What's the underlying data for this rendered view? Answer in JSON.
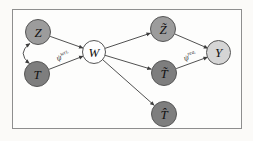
{
  "figure": {
    "type": "causal-graph",
    "nodes": [
      {
        "id": "Z",
        "label": "Z",
        "fill": "#9c9c9c"
      },
      {
        "id": "T",
        "label": "T",
        "fill": "#7e7e7e"
      },
      {
        "id": "W",
        "label": "W",
        "fill": "#fefefe"
      },
      {
        "id": "Z_tilde",
        "label": "Z̃",
        "fill": "#9c9c9c"
      },
      {
        "id": "T_tilde",
        "label": "T̃",
        "fill": "#7e7e7e"
      },
      {
        "id": "T_hat",
        "label": "T̂",
        "fill": "#7e7e7e"
      },
      {
        "id": "Y",
        "label": "Y",
        "fill": "#d5d5d5"
      }
    ],
    "edges": [
      {
        "from": "Z",
        "to": "W",
        "style": "arrow"
      },
      {
        "from": "T",
        "to": "W",
        "style": "arrow",
        "label_ref": "psi_wri"
      },
      {
        "from": "Z",
        "to": "T",
        "style": "curved-bidirectional"
      },
      {
        "from": "W",
        "to": "Z_tilde",
        "style": "arrow"
      },
      {
        "from": "W",
        "to": "T_tilde",
        "style": "arrow"
      },
      {
        "from": "W",
        "to": "T_hat",
        "style": "arrow"
      },
      {
        "from": "Z_tilde",
        "to": "Y",
        "style": "arrow"
      },
      {
        "from": "T_tilde",
        "to": "Y",
        "style": "arrow",
        "label_ref": "psi_rea"
      }
    ],
    "edge_labels": {
      "psi_wri": {
        "base": "ψ",
        "sup": "wri."
      },
      "psi_rea": {
        "base": "ψ",
        "sup": "rea."
      }
    },
    "colors": {
      "edge": "#3d3d3d",
      "node_border": "#565656",
      "frame_border": "#8e8e8e",
      "background": "#fbfaf8",
      "node_text": "#111111"
    }
  }
}
